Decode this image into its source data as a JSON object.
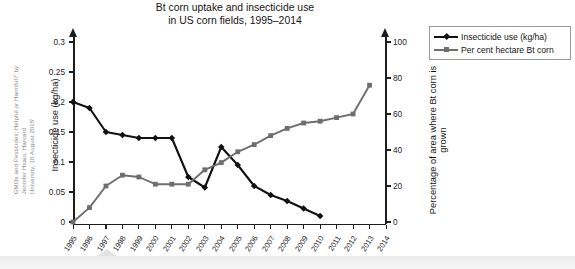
{
  "title": "Bt corn uptake and insecticide use\nin US corn fields, 1995–2014",
  "source_caption": "GMOs and Pesticides: Helpful or Harmful?' by Jennifer Hsaio, Harvard\nUniversity, 10 August 2015'",
  "legend": {
    "position": "top-right",
    "items": [
      {
        "label": "Insecticide use (kg/ha)",
        "color": "#111111",
        "marker": "diamond"
      },
      {
        "label": "Per cent hectare Bt corn",
        "color": "#6e6e6e",
        "marker": "square"
      }
    ]
  },
  "axes": {
    "left": {
      "title": "Insecticide use (kg/ha)",
      "ticks": [
        "0",
        "0.05",
        "0.1",
        "0.15",
        "0.2",
        "0.25",
        "0.3"
      ],
      "min": 0,
      "max": 0.3
    },
    "right": {
      "title": "Percentage of area where Bt corn is grown",
      "ticks": [
        "0",
        "20",
        "40",
        "60",
        "80",
        "100"
      ],
      "min": 0,
      "max": 100
    },
    "x": {
      "title": "",
      "ticks": [
        "1995",
        "1996",
        "1997",
        "1998",
        "1999",
        "2000",
        "2001",
        "2002",
        "2003",
        "2004",
        "2005",
        "2006",
        "2007",
        "2008",
        "2009",
        "2010",
        "2011",
        "2012",
        "2013",
        "2014"
      ]
    }
  },
  "chart_data": {
    "type": "line",
    "title": "Bt corn uptake and insecticide use in US corn fields, 1995–2014",
    "xlabel": "",
    "ylabel": "Insecticide use (kg/ha)",
    "y2label": "Percentage of area where Bt corn is grown",
    "x": [
      1995,
      1996,
      1997,
      1998,
      1999,
      2000,
      2001,
      2002,
      2003,
      2004,
      2005,
      2006,
      2007,
      2008,
      2009,
      2010,
      2011,
      2012,
      2013,
      2014
    ],
    "ylim": [
      0,
      0.3
    ],
    "y2lim": [
      0,
      100
    ],
    "grid": false,
    "legend_position": "top-right",
    "series": [
      {
        "name": "Insecticide use (kg/ha)",
        "axis": "left",
        "color": "#111111",
        "marker": "diamond",
        "values": [
          0.2,
          0.19,
          0.15,
          0.145,
          0.14,
          0.14,
          0.14,
          0.075,
          0.0575,
          0.125,
          0.095,
          0.06,
          0.045,
          0.035,
          0.0225,
          0.01,
          null,
          null,
          null,
          null
        ]
      },
      {
        "name": "Per cent hectare Bt corn",
        "axis": "right",
        "color": "#6e6e6e",
        "marker": "square",
        "values": [
          0,
          8,
          20,
          26,
          25,
          21,
          21,
          21,
          29,
          33,
          39,
          43,
          48,
          52,
          55,
          56,
          58,
          60,
          76,
          null
        ]
      }
    ]
  }
}
